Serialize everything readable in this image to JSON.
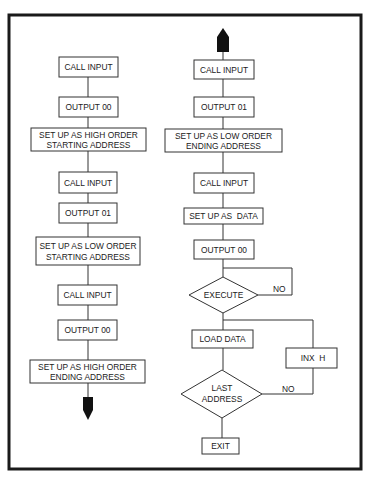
{
  "diagram": {
    "type": "flowchart",
    "left_column": {
      "steps": [
        {
          "id": "l1",
          "label": [
            "CALL INPUT"
          ]
        },
        {
          "id": "l2",
          "label": [
            "OUTPUT 00"
          ]
        },
        {
          "id": "l3",
          "label": [
            "SET UP AS HIGH ORDER",
            "STARTING ADDRESS"
          ]
        },
        {
          "id": "l4",
          "label": [
            "CALL INPUT"
          ]
        },
        {
          "id": "l5",
          "label": [
            "OUTPUT 01"
          ]
        },
        {
          "id": "l6",
          "label": [
            "SET UP AS LOW ORDER",
            "STARTING ADDRESS"
          ]
        },
        {
          "id": "l7",
          "label": [
            "CALL INPUT"
          ]
        },
        {
          "id": "l8",
          "label": [
            "OUTPUT 00"
          ]
        },
        {
          "id": "l9",
          "label": [
            "SET UP AS HIGH ORDER",
            "ENDING ADDRESS"
          ]
        }
      ],
      "continuation": "arrow-down"
    },
    "right_column": {
      "continuation": "arrow-up",
      "steps": [
        {
          "id": "r1",
          "label": [
            "CALL INPUT"
          ]
        },
        {
          "id": "r2",
          "label": [
            "OUTPUT 01"
          ]
        },
        {
          "id": "r3",
          "label": [
            "SET UP AS LOW ORDER",
            "ENDING ADDRESS"
          ]
        },
        {
          "id": "r4",
          "label": [
            "CALL INPUT"
          ]
        },
        {
          "id": "r5",
          "label": [
            "SET UP AS  DATA"
          ]
        },
        {
          "id": "r6",
          "label": [
            "OUTPUT 00"
          ]
        },
        {
          "id": "d1",
          "shape": "decision",
          "label": [
            "EXECUTE"
          ],
          "no_label": "NO"
        },
        {
          "id": "r7",
          "label": [
            "LOAD DATA"
          ]
        },
        {
          "id": "r8",
          "label": [
            "INX  H"
          ]
        },
        {
          "id": "d2",
          "shape": "decision",
          "label": [
            "LAST",
            "ADDRESS"
          ],
          "no_label": "NO"
        },
        {
          "id": "r9",
          "label": [
            "EXIT"
          ]
        }
      ]
    },
    "edges": [
      [
        "l1",
        "l2"
      ],
      [
        "l2",
        "l3"
      ],
      [
        "l3",
        "l4"
      ],
      [
        "l4",
        "l5"
      ],
      [
        "l5",
        "l6"
      ],
      [
        "l6",
        "l7"
      ],
      [
        "l7",
        "l8"
      ],
      [
        "l8",
        "l9"
      ],
      [
        "r1",
        "r2"
      ],
      [
        "r2",
        "r3"
      ],
      [
        "r3",
        "r4"
      ],
      [
        "r4",
        "r5"
      ],
      [
        "r5",
        "r6"
      ],
      [
        "r6",
        "d1"
      ],
      [
        "d1",
        "d1",
        "NO"
      ],
      [
        "d1",
        "r7"
      ],
      [
        "r7",
        "d2"
      ],
      [
        "d2",
        "r8",
        "NO"
      ],
      [
        "r8",
        "r7"
      ],
      [
        "d2",
        "r9"
      ]
    ]
  }
}
